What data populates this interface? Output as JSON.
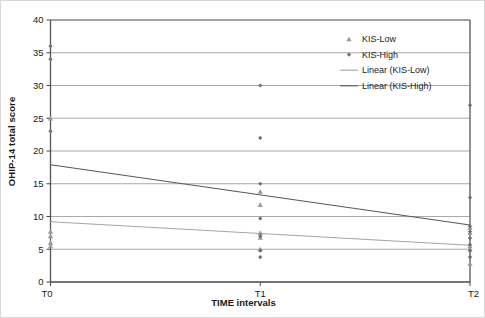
{
  "chart_data": {
    "type": "scatter",
    "title": "",
    "xlabel": "TIME intervals",
    "ylabel": "OHIP-14 total score",
    "categories": [
      "T0",
      "T1",
      "T2"
    ],
    "x_tick_labels": [
      "T0",
      "T1",
      "T2"
    ],
    "y_tick_labels": [
      "0",
      "5",
      "10",
      "15",
      "20",
      "25",
      "30",
      "35",
      "40"
    ],
    "y_ticks": [
      0,
      5,
      10,
      15,
      20,
      25,
      30,
      35,
      40
    ],
    "ylim": [
      0,
      40
    ],
    "xlim": [
      0,
      2
    ],
    "grid": "horizontal",
    "legend_position": "top-right",
    "series": [
      {
        "name": "KIS-Low",
        "marker": "triangle",
        "color": "#9a9a9a",
        "points": [
          {
            "x": "T0",
            "y": 25
          },
          {
            "x": "T0",
            "y": 7.7
          },
          {
            "x": "T0",
            "y": 7.0
          },
          {
            "x": "T0",
            "y": 6.0
          },
          {
            "x": "T0",
            "y": 5.5
          },
          {
            "x": "T1",
            "y": 13.8
          },
          {
            "x": "T1",
            "y": 11.8
          },
          {
            "x": "T1",
            "y": 7.5
          },
          {
            "x": "T1",
            "y": 6.8
          },
          {
            "x": "T1",
            "y": 5.0
          },
          {
            "x": "T2",
            "y": 8.3
          },
          {
            "x": "T2",
            "y": 7.5
          },
          {
            "x": "T2",
            "y": 5.5
          },
          {
            "x": "T2",
            "y": 5.0
          },
          {
            "x": "T2",
            "y": 2.8
          }
        ]
      },
      {
        "name": "KIS-High",
        "marker": "diamond",
        "color": "#6e6e6e",
        "points": [
          {
            "x": "T0",
            "y": 36
          },
          {
            "x": "T0",
            "y": 34
          },
          {
            "x": "T0",
            "y": 23
          },
          {
            "x": "T1",
            "y": 30
          },
          {
            "x": "T1",
            "y": 22
          },
          {
            "x": "T1",
            "y": 15
          },
          {
            "x": "T1",
            "y": 9.7
          },
          {
            "x": "T1",
            "y": 7.0
          },
          {
            "x": "T1",
            "y": 4.8
          },
          {
            "x": "T1",
            "y": 3.8
          },
          {
            "x": "T2",
            "y": 27
          },
          {
            "x": "T2",
            "y": 12.9
          },
          {
            "x": "T2",
            "y": 8.5
          },
          {
            "x": "T2",
            "y": 7.7
          },
          {
            "x": "T2",
            "y": 6.7
          },
          {
            "x": "T2",
            "y": 5.7
          },
          {
            "x": "T2",
            "y": 4.8
          },
          {
            "x": "T2",
            "y": 3.8
          }
        ]
      }
    ],
    "trendlines": [
      {
        "name": "Linear (KIS-Low)",
        "color": "#a5a5a5",
        "x0": "T0",
        "y0": 9.2,
        "x1": "T2",
        "y1": 5.6
      },
      {
        "name": "Linear (KIS-High)",
        "color": "#585858",
        "x0": "T0",
        "y0": 17.9,
        "x1": "T2",
        "y1": 8.7
      }
    ],
    "legend": [
      {
        "label": "KIS-Low",
        "type": "marker",
        "marker": "triangle",
        "color": "#9a9a9a"
      },
      {
        "label": "KIS-High",
        "type": "marker",
        "marker": "diamond",
        "color": "#6e6e6e"
      },
      {
        "label": "Linear (KIS-Low)",
        "type": "line",
        "color": "#a5a5a5"
      },
      {
        "label": "Linear (KIS-High)",
        "type": "line",
        "color": "#585858"
      }
    ],
    "axis_color": "#555555",
    "grid_color": "#8c8c8c"
  }
}
